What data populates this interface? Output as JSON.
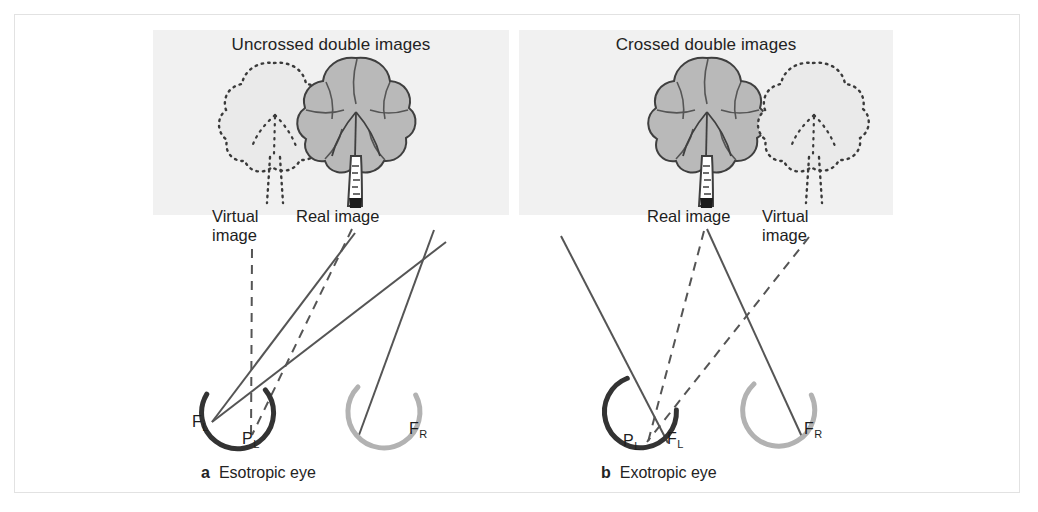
{
  "figure": {
    "type": "medical-illustration",
    "background_color": "#ffffff",
    "frame_border_color": "#e2e2e2",
    "scene_background_color": "#f1f1f1"
  },
  "colors": {
    "left_eye_arc": "#333333",
    "right_eye_arc": "#b2b2b2",
    "ray_solid": "#555555",
    "ray_dashed": "#555555",
    "tree_foliage": "#b9b9b9",
    "tree_outline": "#4a4a4a",
    "text": "#232323"
  },
  "panels": [
    {
      "id": "a",
      "letter": "a",
      "title": "Uncrossed double images",
      "caption": "Esotropic eye",
      "tree_left": {
        "label_line1": "Virtual",
        "label_line2": "image",
        "style": "dotted"
      },
      "tree_right": {
        "label_line1": "Real image",
        "label_line2": "",
        "style": "solid"
      },
      "eye_left": {
        "fovea_label": "F",
        "fovea_sub": "L",
        "pupil_label": "P",
        "pupil_sub": "L"
      },
      "eye_right": {
        "fovea_label": "F",
        "fovea_sub": "R"
      }
    },
    {
      "id": "b",
      "letter": "b",
      "title": "Crossed double images",
      "caption": "Exotropic eye",
      "tree_left": {
        "label_line1": "Real image",
        "label_line2": "",
        "style": "solid"
      },
      "tree_right": {
        "label_line1": "Virtual",
        "label_line2": "image",
        "style": "dotted"
      },
      "eye_left": {
        "fovea_label": "F",
        "fovea_sub": "L",
        "pupil_label": "P",
        "pupil_sub": "L"
      },
      "eye_right": {
        "fovea_label": "F",
        "fovea_sub": "R"
      }
    }
  ]
}
